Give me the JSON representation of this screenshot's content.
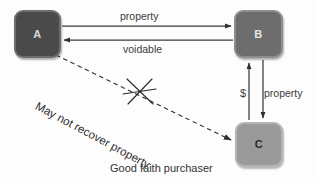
{
  "diagram": {
    "nodes": [
      {
        "id": "A",
        "label": "A"
      },
      {
        "id": "B",
        "label": "B"
      },
      {
        "id": "C",
        "label": "C"
      }
    ],
    "edge_labels": {
      "property_top": "property",
      "voidable": "voidable",
      "dollar": "$",
      "property_right": "property",
      "may_not_recover": "May not recover property"
    },
    "caption": "Good faith purchaser",
    "colors": {
      "background": "#fdfdfd",
      "node_a_fill": "#4a4a4a",
      "node_b_fill": "#6d6d6d",
      "node_c_fill": "#9a9a9a",
      "stroke": "#3a3a3a",
      "text": "#3c3c3c"
    }
  }
}
